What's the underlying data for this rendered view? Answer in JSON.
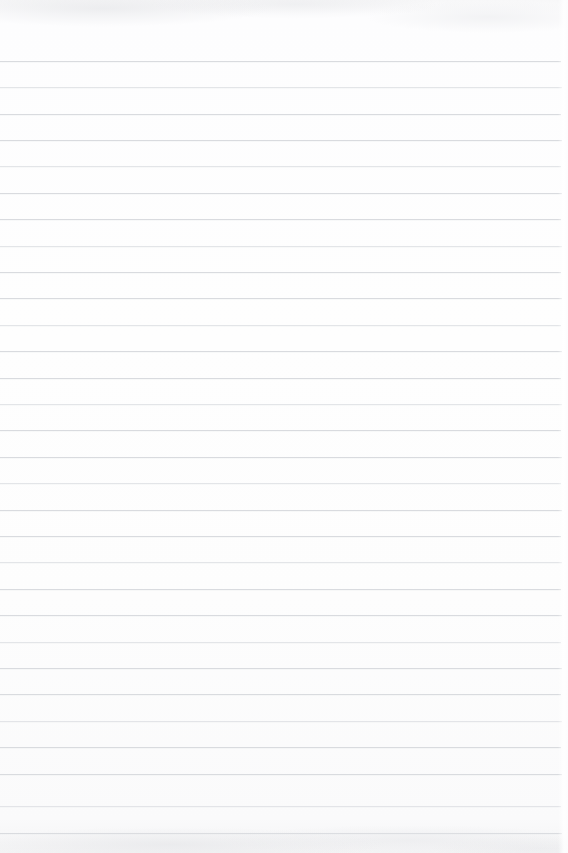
{
  "document": {
    "type": "blank-ruled-paper-scan",
    "title": "Blank Ruled Paper",
    "content_text": "",
    "has_handwriting": false,
    "has_printed_text": false,
    "has_margin_rule": false,
    "page_width": 568,
    "page_height": 853
  },
  "paper": {
    "background_color": "#fdfdfd",
    "rule_color": "#d8dade",
    "rule_color_faint": "#dfe1e5",
    "rule_thickness": 1,
    "rule_count": 30,
    "first_rule_y": 61,
    "rule_spacing": 26.4,
    "rule_left_x": 0,
    "rule_right_x": 562,
    "top_margin": 61,
    "right_margin": 6
  },
  "rules": [
    {
      "y": 61,
      "x1": 0,
      "x2": 561,
      "faint": false
    },
    {
      "y": 87,
      "x1": 0,
      "x2": 562,
      "faint": true
    },
    {
      "y": 114,
      "x1": 0,
      "x2": 561,
      "faint": false
    },
    {
      "y": 140,
      "x1": 0,
      "x2": 562,
      "faint": false
    },
    {
      "y": 166,
      "x1": 0,
      "x2": 561,
      "faint": true
    },
    {
      "y": 193,
      "x1": 0,
      "x2": 562,
      "faint": false
    },
    {
      "y": 219,
      "x1": 0,
      "x2": 561,
      "faint": false
    },
    {
      "y": 246,
      "x1": 0,
      "x2": 562,
      "faint": true
    },
    {
      "y": 272,
      "x1": 0,
      "x2": 561,
      "faint": false
    },
    {
      "y": 298,
      "x1": 0,
      "x2": 562,
      "faint": false
    },
    {
      "y": 325,
      "x1": 0,
      "x2": 561,
      "faint": true
    },
    {
      "y": 351,
      "x1": 0,
      "x2": 562,
      "faint": false
    },
    {
      "y": 378,
      "x1": 0,
      "x2": 561,
      "faint": false
    },
    {
      "y": 404,
      "x1": 0,
      "x2": 562,
      "faint": true
    },
    {
      "y": 430,
      "x1": 0,
      "x2": 561,
      "faint": false
    },
    {
      "y": 457,
      "x1": 0,
      "x2": 562,
      "faint": false
    },
    {
      "y": 483,
      "x1": 0,
      "x2": 561,
      "faint": true
    },
    {
      "y": 510,
      "x1": 0,
      "x2": 562,
      "faint": false
    },
    {
      "y": 536,
      "x1": 0,
      "x2": 561,
      "faint": false
    },
    {
      "y": 562,
      "x1": 0,
      "x2": 562,
      "faint": true
    },
    {
      "y": 589,
      "x1": 0,
      "x2": 561,
      "faint": false
    },
    {
      "y": 615,
      "x1": 0,
      "x2": 562,
      "faint": false
    },
    {
      "y": 642,
      "x1": 0,
      "x2": 561,
      "faint": true
    },
    {
      "y": 668,
      "x1": 0,
      "x2": 562,
      "faint": false
    },
    {
      "y": 694,
      "x1": 0,
      "x2": 561,
      "faint": false
    },
    {
      "y": 721,
      "x1": 0,
      "x2": 562,
      "faint": true
    },
    {
      "y": 747,
      "x1": 0,
      "x2": 561,
      "faint": false
    },
    {
      "y": 774,
      "x1": 0,
      "x2": 562,
      "faint": false
    },
    {
      "y": 806,
      "x1": 0,
      "x2": 561,
      "faint": true
    },
    {
      "y": 833,
      "x1": 0,
      "x2": 562,
      "faint": false
    }
  ]
}
